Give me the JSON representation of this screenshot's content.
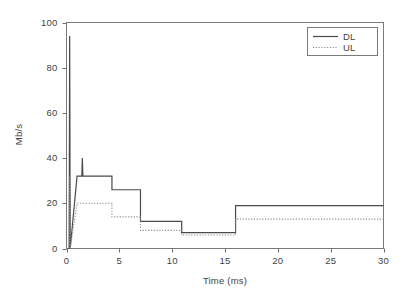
{
  "chart_data": {
    "type": "line",
    "title": "",
    "xlabel": "Time (ms)",
    "ylabel": "Mb/s",
    "xlim": [
      0,
      30
    ],
    "ylim": [
      0,
      100
    ],
    "xticks": [
      0,
      5,
      10,
      15,
      20,
      25,
      30
    ],
    "yticks": [
      0,
      20,
      40,
      60,
      80,
      100
    ],
    "xtick_labels": [
      "0",
      "5",
      "10",
      "15",
      "20",
      "25",
      "30"
    ],
    "ytick_labels": [
      "0",
      "20",
      "40",
      "60",
      "80",
      "100"
    ],
    "grid": false,
    "legend_position": "top-right",
    "series": [
      {
        "name": "DL",
        "style": "solid",
        "color": "#4a4a4a",
        "x": [
          0.0,
          0.25,
          0.3,
          0.35,
          1.0,
          1.45,
          1.5,
          1.55,
          4.3,
          4.3,
          7.0,
          7.0,
          10.9,
          10.9,
          16.0,
          16.0,
          30.0
        ],
        "y": [
          0,
          0,
          94,
          0,
          32,
          32,
          40,
          32,
          32,
          26,
          26,
          12,
          12,
          7,
          7,
          19,
          19
        ]
      },
      {
        "name": "UL",
        "style": "dotted",
        "color": "#8d8d8d",
        "x": [
          0.0,
          0.25,
          0.3,
          0.35,
          1.0,
          4.3,
          4.3,
          7.0,
          7.0,
          10.9,
          10.9,
          16.0,
          16.0,
          30.0
        ],
        "y": [
          0,
          0,
          32,
          0,
          20,
          20,
          14,
          14,
          8,
          8,
          6,
          6,
          13,
          13
        ]
      }
    ],
    "annotations": [
      {
        "text": "initial DL burst peak",
        "x": 0.3,
        "y": 94
      },
      {
        "text": "secondary DL spike",
        "x": 1.5,
        "y": 40
      }
    ]
  },
  "legend": {
    "entries": [
      {
        "label": "DL",
        "swatch": "solid-line-swatch"
      },
      {
        "label": "UL",
        "swatch": "dotted-line-swatch"
      }
    ]
  },
  "axes": {
    "x_title": "Time (ms)",
    "y_title": "Mb/s"
  },
  "colors": {
    "dl_line": "#4a4a4a",
    "ul_line": "#8d8d8d",
    "frame": "#7a7a7a",
    "text": "#3f3f3f",
    "background": "#ffffff"
  }
}
